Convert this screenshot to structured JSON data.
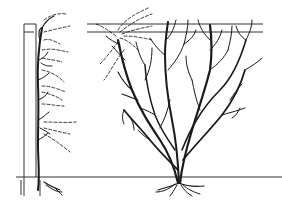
{
  "figure": {
    "type": "botanical line illustration",
    "colors": {
      "ink": "#1a1a1a",
      "background": "#ffffff"
    },
    "panels": [
      {
        "name": "wall-trained-shrub",
        "label": ""
      },
      {
        "name": "freestanding-bush",
        "label": ""
      }
    ]
  }
}
